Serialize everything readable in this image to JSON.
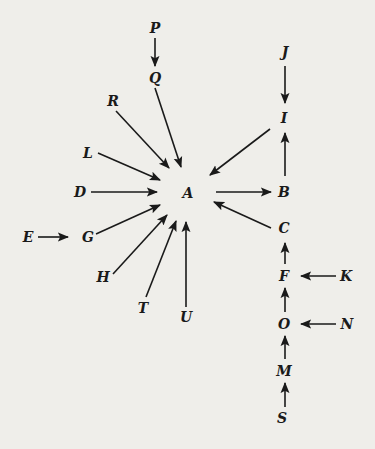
{
  "diagram": {
    "type": "directed-graph",
    "colors": {
      "background": "#efeeea",
      "ink": "#1a1a1a"
    },
    "nodes": [
      {
        "id": "P",
        "label": "P",
        "x": 155,
        "y": 28
      },
      {
        "id": "Q",
        "label": "Q",
        "x": 155,
        "y": 78
      },
      {
        "id": "J",
        "label": "J",
        "x": 285,
        "y": 52
      },
      {
        "id": "I",
        "label": "I",
        "x": 284,
        "y": 118
      },
      {
        "id": "R",
        "label": "R",
        "x": 113,
        "y": 101
      },
      {
        "id": "L",
        "label": "L",
        "x": 88,
        "y": 153
      },
      {
        "id": "D",
        "label": "D",
        "x": 80,
        "y": 192
      },
      {
        "id": "A",
        "label": "A",
        "x": 188,
        "y": 193
      },
      {
        "id": "B",
        "label": "B",
        "x": 284,
        "y": 192
      },
      {
        "id": "C",
        "label": "C",
        "x": 284,
        "y": 228
      },
      {
        "id": "E",
        "label": "E",
        "x": 28,
        "y": 237
      },
      {
        "id": "G",
        "label": "G",
        "x": 88,
        "y": 237
      },
      {
        "id": "H",
        "label": "H",
        "x": 103,
        "y": 277
      },
      {
        "id": "T",
        "label": "T",
        "x": 143,
        "y": 308
      },
      {
        "id": "U",
        "label": "U",
        "x": 186,
        "y": 317
      },
      {
        "id": "F",
        "label": "F",
        "x": 284,
        "y": 276
      },
      {
        "id": "K",
        "label": "K",
        "x": 346,
        "y": 276
      },
      {
        "id": "O",
        "label": "O",
        "x": 284,
        "y": 324
      },
      {
        "id": "N",
        "label": "N",
        "x": 347,
        "y": 324
      },
      {
        "id": "M",
        "label": "M",
        "x": 284,
        "y": 371
      },
      {
        "id": "S",
        "label": "S",
        "x": 282,
        "y": 418
      }
    ],
    "edges": [
      {
        "from": "P",
        "to": "Q",
        "x1": 155,
        "y1": 38,
        "x2": 155,
        "y2": 66
      },
      {
        "from": "Q",
        "to": "A",
        "x1": 155,
        "y1": 88,
        "x2": 181,
        "y2": 167
      },
      {
        "from": "R",
        "to": "A",
        "x1": 116,
        "y1": 111,
        "x2": 169,
        "y2": 168
      },
      {
        "from": "L",
        "to": "A",
        "x1": 98,
        "y1": 153,
        "x2": 160,
        "y2": 180
      },
      {
        "from": "D",
        "to": "A",
        "x1": 91,
        "y1": 192,
        "x2": 157,
        "y2": 192
      },
      {
        "from": "G",
        "to": "A",
        "x1": 96,
        "y1": 234,
        "x2": 160,
        "y2": 205
      },
      {
        "from": "E",
        "to": "G",
        "x1": 38,
        "y1": 237,
        "x2": 68,
        "y2": 237
      },
      {
        "from": "H",
        "to": "A",
        "x1": 113,
        "y1": 274,
        "x2": 167,
        "y2": 215
      },
      {
        "from": "T",
        "to": "A",
        "x1": 146,
        "y1": 297,
        "x2": 176,
        "y2": 221
      },
      {
        "from": "U",
        "to": "A",
        "x1": 186,
        "y1": 307,
        "x2": 186,
        "y2": 222
      },
      {
        "from": "A",
        "to": "B",
        "x1": 216,
        "y1": 192,
        "x2": 271,
        "y2": 192
      },
      {
        "from": "C",
        "to": "A",
        "x1": 271,
        "y1": 228,
        "x2": 214,
        "y2": 202
      },
      {
        "from": "I",
        "to": "A",
        "x1": 270,
        "y1": 129,
        "x2": 210,
        "y2": 175
      },
      {
        "from": "B",
        "to": "I",
        "x1": 285,
        "y1": 176,
        "x2": 285,
        "y2": 133
      },
      {
        "from": "J",
        "to": "I",
        "x1": 285,
        "y1": 66,
        "x2": 285,
        "y2": 103
      },
      {
        "from": "F",
        "to": "C",
        "x1": 285,
        "y1": 264,
        "x2": 285,
        "y2": 243
      },
      {
        "from": "K",
        "to": "F",
        "x1": 336,
        "y1": 276,
        "x2": 301,
        "y2": 276
      },
      {
        "from": "O",
        "to": "F",
        "x1": 285,
        "y1": 312,
        "x2": 285,
        "y2": 288
      },
      {
        "from": "N",
        "to": "O",
        "x1": 336,
        "y1": 324,
        "x2": 301,
        "y2": 324
      },
      {
        "from": "M",
        "to": "O",
        "x1": 285,
        "y1": 359,
        "x2": 285,
        "y2": 336
      },
      {
        "from": "S",
        "to": "M",
        "x1": 285,
        "y1": 407,
        "x2": 285,
        "y2": 383
      }
    ]
  }
}
